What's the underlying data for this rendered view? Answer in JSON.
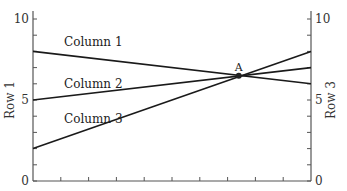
{
  "chart_data": {
    "type": "line",
    "title": "",
    "xlabel": "",
    "ylabel_left": "Row 1",
    "ylabel_right": "Row 3",
    "x": [
      0,
      10
    ],
    "xlim": [
      0,
      10
    ],
    "x_ticks": 10,
    "x_tick_labels": [],
    "ylim": [
      0,
      10
    ],
    "y_tick_labels_left": [
      "0",
      "5",
      "10"
    ],
    "y_tick_labels_right": [
      "0",
      "5",
      "10"
    ],
    "y_minor_step": 1,
    "grid": false,
    "legend": "inline labels",
    "series": [
      {
        "name": "Column 1",
        "values": [
          8.0,
          6.0
        ],
        "color": "#1a1a1a"
      },
      {
        "name": "Column 2",
        "values": [
          5.0,
          7.0
        ],
        "color": "#1a1a1a"
      },
      {
        "name": "Column 3",
        "values": [
          2.0,
          8.0
        ],
        "color": "#1a1a1a"
      }
    ],
    "annotations": [
      {
        "label": "A",
        "x": 7.4,
        "y": 6.5,
        "marker": "dot"
      }
    ]
  }
}
